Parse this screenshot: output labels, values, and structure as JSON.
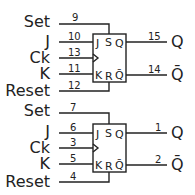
{
  "flipflops": [
    {
      "inputs": [
        {
          "name": "Set",
          "pin": "9"
        },
        {
          "name": "J",
          "pin": "10"
        },
        {
          "name": "Ck",
          "pin": "13"
        },
        {
          "name": "K",
          "pin": "11"
        },
        {
          "name": "Reset",
          "pin": "12"
        }
      ],
      "outputs": [
        {
          "name": "Q",
          "pin": "15"
        },
        {
          "name": "Q̄",
          "pin": "14"
        }
      ],
      "box_labels": {
        "j": "J",
        "s": "S",
        "q": "Q",
        "k": "K",
        "r": "R",
        "qbar": "Q̄"
      }
    },
    {
      "inputs": [
        {
          "name": "Set",
          "pin": "7"
        },
        {
          "name": "J",
          "pin": "6"
        },
        {
          "name": "Ck",
          "pin": "3"
        },
        {
          "name": "K",
          "pin": "5"
        },
        {
          "name": "Reset",
          "pin": "4"
        }
      ],
      "outputs": [
        {
          "name": "Q",
          "pin": "1"
        },
        {
          "name": "Q̄",
          "pin": "2"
        }
      ],
      "box_labels": {
        "j": "J",
        "s": "S",
        "q": "Q",
        "k": "K",
        "r": "R",
        "qbar": "Q̄"
      }
    }
  ]
}
